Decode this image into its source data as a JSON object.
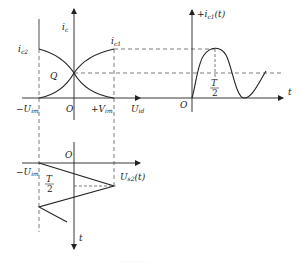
{
  "diagram": {
    "type": "transfer-characteristic-waveform-projection",
    "colors": {
      "line": "#222222",
      "dash": "#444444",
      "background": "#ffffff"
    },
    "transfer_plot": {
      "y_axis_label": "i",
      "y_axis_sub": "c",
      "x_axis_label": "U",
      "x_axis_sub": "id",
      "origin_label": "O",
      "neg_tick_label": "−U",
      "neg_tick_sub": "im",
      "pos_tick_label": "+V",
      "pos_tick_sub": "im",
      "curve_left_label": "i",
      "curve_left_sub": "c2",
      "curve_right_label": "i",
      "curve_right_sub": "c1",
      "quiescent_label": "Q"
    },
    "output_wave_plot": {
      "y_axis_label": "+i",
      "y_axis_sub": "c1",
      "y_axis_suffix": "(t)",
      "x_axis_label": "t",
      "origin_label": "O",
      "half_period_num": "T",
      "half_period_den": "2"
    },
    "input_wave_plot": {
      "origin_label": "O",
      "neg_tick_label": "−U",
      "neg_tick_sub": "im",
      "wave_label": "U",
      "wave_sub": "s2",
      "wave_suffix": "(t)",
      "time_axis_label": "t",
      "half_period_num": "T",
      "half_period_den": "2"
    },
    "caption": "· · · · · · · ·"
  }
}
